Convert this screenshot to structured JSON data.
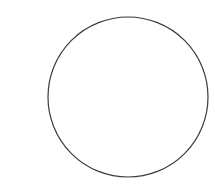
{
  "diagram": {
    "background": "#ffffff",
    "shapes": [
      {
        "type": "circle",
        "cx": 128,
        "cy": 97,
        "r": 80,
        "stroke": "#3a3a3a",
        "stroke_width": 1.2,
        "fill": "none"
      }
    ]
  }
}
